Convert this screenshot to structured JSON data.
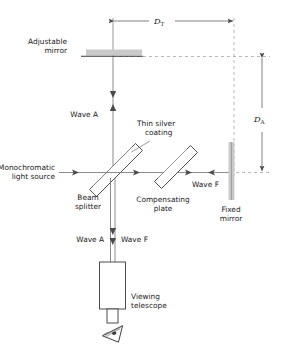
{
  "figure": {
    "type": "optics-ray-diagram",
    "name": "Michelson interferometer",
    "background_color": "#ffffff",
    "line_color": "#4a4a4a",
    "mirror_fill": "#c9c9c9",
    "text_color": "#1a1a1a"
  },
  "labels": {
    "adjustable_mirror_line1": "Adjustable",
    "adjustable_mirror_line2": "mirror",
    "thin_silver_line1": "Thin silver",
    "thin_silver_line2": "coating",
    "monochromatic_line1": "Monochromatic",
    "monochromatic_line2": "light source",
    "beam_splitter_line1": "Beam",
    "beam_splitter_line2": "splitter",
    "compensating_line1": "Compensating",
    "compensating_line2": "plate",
    "fixed_mirror_line1": "Fixed",
    "fixed_mirror_line2": "mirror",
    "wave_a_upper": "Wave A",
    "wave_f_right": "Wave F",
    "wave_a_lower": "Wave A",
    "wave_f_lower": "Wave F",
    "telescope_line1": "Viewing",
    "telescope_line2": "telescope"
  },
  "dimensions": {
    "d_t_symbol": "D",
    "d_t_subscript": "T",
    "d_a_symbol": "D",
    "d_a_subscript": "A"
  },
  "components": [
    {
      "id": "adjustable-mirror",
      "label": "Adjustable mirror",
      "orientation": "horizontal"
    },
    {
      "id": "beam-splitter",
      "label": "Beam splitter",
      "orientation": "45-degree"
    },
    {
      "id": "compensating-plate",
      "label": "Compensating plate",
      "orientation": "45-degree"
    },
    {
      "id": "fixed-mirror",
      "label": "Fixed mirror",
      "orientation": "vertical"
    },
    {
      "id": "viewing-telescope",
      "label": "Viewing telescope",
      "orientation": "vertical"
    },
    {
      "id": "eye",
      "label": "observer eye",
      "orientation": "tilted"
    }
  ],
  "beams": [
    {
      "id": "source-beam",
      "label": "Monochromatic light source",
      "direction": "rightward"
    },
    {
      "id": "wave-a-beam",
      "label": "Wave A",
      "direction": "vertical-bidirectional"
    },
    {
      "id": "wave-f-beam",
      "label": "Wave F",
      "direction": "horizontal-bidirectional"
    },
    {
      "id": "output-beam",
      "label": "Wave A / Wave F",
      "direction": "downward"
    }
  ]
}
